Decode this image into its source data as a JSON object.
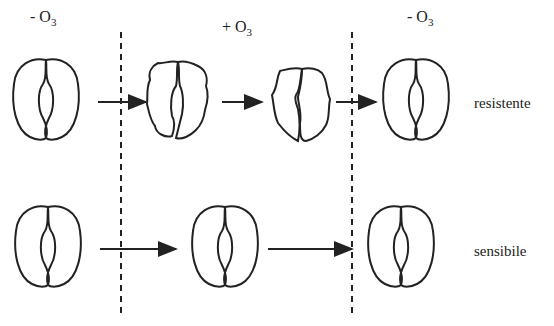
{
  "columns": [
    {
      "label": "- O",
      "sub": "3",
      "x": 30
    },
    {
      "label": "+ O",
      "sub": "3",
      "x": 222
    },
    {
      "label": "- O",
      "sub": "3",
      "x": 407
    }
  ],
  "rows": [
    {
      "label": "resistente",
      "description": "stomata close under ozone exposure, then reopen"
    },
    {
      "label": "sensibile",
      "description": "stomata remain open throughout"
    }
  ],
  "colors": {
    "stroke": "#222222",
    "background": "#ffffff"
  }
}
